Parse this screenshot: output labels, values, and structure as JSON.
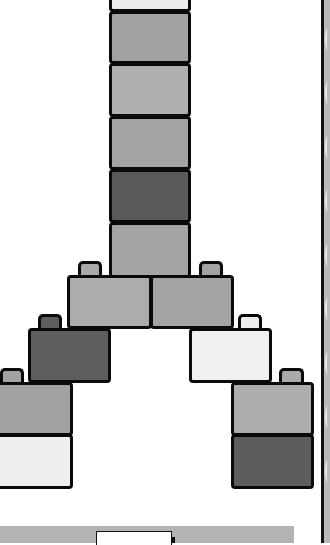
{
  "scene": {
    "description": "Stacked toy building bricks forming an inverted-Y / tower shape",
    "colors": {
      "outline": "#0a0a0a",
      "background": "#ffffff",
      "dark": "#5c5c5c",
      "medium": "#9f9f9f",
      "medium_light": "#acacac",
      "light": "#eeeeee",
      "side_strip": "#b9b9b9",
      "bottom_strip": "#b3b3b3"
    },
    "column_bricks": [
      {
        "id": "column-brick-1",
        "shade": "light",
        "color": "#ececec"
      },
      {
        "id": "column-brick-2",
        "shade": "medium",
        "color": "#a2a2a2"
      },
      {
        "id": "column-brick-3",
        "shade": "medium-light",
        "color": "#b0b0b0"
      },
      {
        "id": "column-brick-4",
        "shade": "medium",
        "color": "#a3a3a3"
      },
      {
        "id": "column-brick-5",
        "shade": "dark",
        "color": "#5a5a5a"
      },
      {
        "id": "column-brick-6",
        "shade": "medium",
        "color": "#a4a4a4"
      }
    ],
    "left_branch": [
      {
        "id": "left-brick-1",
        "shade": "medium-light",
        "color": "#acacac"
      },
      {
        "id": "left-brick-2",
        "shade": "dark",
        "color": "#5e5e5e"
      },
      {
        "id": "left-brick-3",
        "shade": "medium",
        "color": "#a2a2a2"
      },
      {
        "id": "left-brick-4",
        "shade": "light",
        "color": "#efefef"
      }
    ],
    "right_branch": [
      {
        "id": "right-brick-1",
        "shade": "medium",
        "color": "#a3a3a3"
      },
      {
        "id": "right-brick-2",
        "shade": "light",
        "color": "#f0f0f0"
      },
      {
        "id": "right-brick-3",
        "shade": "medium-light",
        "color": "#adadad"
      },
      {
        "id": "right-brick-4",
        "shade": "dark",
        "color": "#5d5d5d"
      }
    ]
  }
}
